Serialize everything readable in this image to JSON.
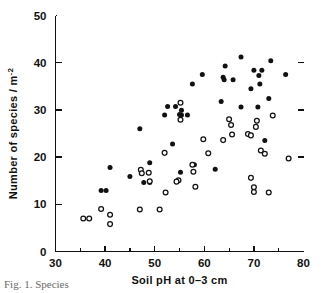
{
  "figure": {
    "caption_fragment": "Fig. 1.  Species",
    "background": "#ffffff",
    "ink_color": "#111111"
  },
  "chart_data": {
    "type": "scatter",
    "title": "",
    "xlabel": "Soil pH at 0–3 cm",
    "ylabel": "Number of species / m⁻²",
    "ylabel_base": "Number of species / m",
    "ylabel_exponent": "-2",
    "xlim": [
      30,
      80
    ],
    "ylim": [
      0,
      50
    ],
    "xticks": [
      30,
      40,
      50,
      60,
      70,
      80
    ],
    "xticklabels": [
      "30",
      "40",
      "50",
      "60",
      "70",
      "80"
    ],
    "xticks_minor": [
      35,
      45,
      55,
      65,
      75
    ],
    "yticks": [
      0,
      10,
      20,
      30,
      40,
      50
    ],
    "yticklabels": [
      "0",
      "10",
      "20",
      "30",
      "40",
      "50"
    ],
    "grid": false,
    "legend": "none",
    "legend_position": "none",
    "marker_styles": {
      "filled": "solid black circle",
      "open": "white circle with black outline"
    },
    "series": [
      {
        "name": "filled",
        "marker": "filled-circle",
        "color": "#111111",
        "points": [
          [
            39.2,
            12.9
          ],
          [
            40.2,
            12.9
          ],
          [
            41.0,
            17.8
          ],
          [
            45.0,
            15.9
          ],
          [
            47.0,
            26.0
          ],
          [
            47.8,
            14.6
          ],
          [
            49.0,
            18.8
          ],
          [
            49.0,
            14.6
          ],
          [
            52.0,
            28.9
          ],
          [
            52.6,
            30.7
          ],
          [
            54.2,
            30.7
          ],
          [
            55.4,
            29.9
          ],
          [
            55.4,
            28.9
          ],
          [
            55.0,
            29.0
          ],
          [
            56.6,
            28.9
          ],
          [
            55.2,
            16.8
          ],
          [
            53.6,
            22.8
          ],
          [
            57.6,
            35.5
          ],
          [
            58.0,
            18.4
          ],
          [
            59.6,
            37.5
          ],
          [
            62.2,
            17.4
          ],
          [
            63.8,
            36.9
          ],
          [
            64.0,
            36.4
          ],
          [
            64.2,
            39.3
          ],
          [
            63.4,
            31.8
          ],
          [
            65.8,
            36.4
          ],
          [
            67.4,
            41.2
          ],
          [
            67.4,
            30.6
          ],
          [
            69.4,
            34.5
          ],
          [
            70.0,
            38.4
          ],
          [
            71.0,
            37.3
          ],
          [
            71.2,
            35.5
          ],
          [
            71.6,
            38.4
          ],
          [
            70.8,
            30.6
          ],
          [
            72.2,
            23.5
          ],
          [
            73.0,
            32.4
          ],
          [
            73.4,
            40.4
          ],
          [
            76.4,
            37.5
          ]
        ]
      },
      {
        "name": "open",
        "marker": "open-circle",
        "color": "#ffffff",
        "points": [
          [
            35.6,
            7.0
          ],
          [
            36.8,
            7.0
          ],
          [
            39.2,
            9.0
          ],
          [
            41.0,
            7.8
          ],
          [
            41.0,
            5.8
          ],
          [
            47.2,
            17.3
          ],
          [
            47.4,
            16.6
          ],
          [
            48.8,
            16.7
          ],
          [
            49.0,
            14.9
          ],
          [
            47.0,
            8.9
          ],
          [
            51.0,
            8.9
          ],
          [
            52.0,
            20.9
          ],
          [
            52.2,
            12.5
          ],
          [
            55.2,
            31.5
          ],
          [
            55.2,
            27.9
          ],
          [
            54.8,
            15.1
          ],
          [
            54.4,
            14.8
          ],
          [
            57.6,
            18.4
          ],
          [
            57.8,
            16.9
          ],
          [
            58.2,
            13.7
          ],
          [
            59.8,
            23.8
          ],
          [
            60.8,
            20.8
          ],
          [
            63.8,
            23.6
          ],
          [
            65.0,
            28.0
          ],
          [
            65.4,
            26.8
          ],
          [
            65.6,
            24.8
          ],
          [
            68.8,
            24.9
          ],
          [
            69.4,
            24.6
          ],
          [
            69.4,
            15.6
          ],
          [
            70.4,
            26.4
          ],
          [
            70.6,
            27.7
          ],
          [
            71.4,
            21.4
          ],
          [
            72.2,
            20.7
          ],
          [
            73.0,
            12.5
          ],
          [
            70.0,
            13.6
          ],
          [
            70.0,
            12.6
          ],
          [
            73.8,
            28.8
          ],
          [
            77.0,
            19.7
          ]
        ]
      }
    ]
  }
}
